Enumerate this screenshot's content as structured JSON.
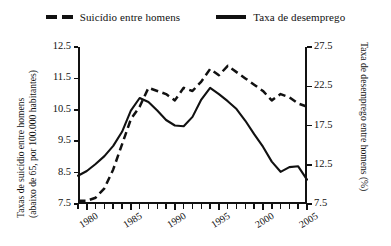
{
  "legend": {
    "items": [
      {
        "label": "Suicídio entre homens",
        "marker": "dashed-line-swatch",
        "color": "#111111"
      },
      {
        "label": "Taxa de desemprego",
        "marker": "solid-line-swatch",
        "color": "#111111"
      }
    ]
  },
  "axes": {
    "left_title_line1": "Taxas de suicídio entre homens",
    "left_title_line2": "(abaixo de 65, por 100.000 habitantes)",
    "right_title": "Taxa de desemprego entre homens (%)",
    "left_ticks": [
      "12.5",
      "11.5",
      "10.5",
      "9.5",
      "8.5",
      "7.5"
    ],
    "right_ticks": [
      "27.5",
      "22.5",
      "17.5",
      "12.5",
      "7.5"
    ],
    "x_ticks": [
      "1980",
      "1985",
      "1990",
      "1995",
      "2000",
      "2005"
    ]
  },
  "chart_data": {
    "type": "line",
    "title": "",
    "xlabel": "",
    "ylabel": "Taxas de suicídio entre homens (abaixo de 65, por 100.000 habitantes)",
    "y2label": "Taxa de desemprego entre homens (%)",
    "xlim": [
      1979,
      2005
    ],
    "ylim": [
      7.5,
      12.5
    ],
    "y2lim": [
      7.5,
      27.5
    ],
    "grid": false,
    "legend_position": "top-center",
    "x": [
      1979,
      1980,
      1981,
      1982,
      1983,
      1984,
      1985,
      1986,
      1987,
      1988,
      1989,
      1990,
      1991,
      1992,
      1993,
      1994,
      1995,
      1996,
      1997,
      1998,
      1999,
      2000,
      2001,
      2002,
      2003,
      2004,
      2005
    ],
    "series": [
      {
        "name": "Suicídio entre homens",
        "axis": "left",
        "style": "dashed",
        "values": [
          7.6,
          7.6,
          7.7,
          8.0,
          8.6,
          9.4,
          10.2,
          10.6,
          11.2,
          11.1,
          11.0,
          10.8,
          11.2,
          11.1,
          11.4,
          11.8,
          11.6,
          11.9,
          11.7,
          11.5,
          11.3,
          11.1,
          10.8,
          11.0,
          10.9,
          10.7,
          10.6
        ]
      },
      {
        "name": "Taxa de desemprego",
        "axis": "right",
        "style": "solid",
        "values": [
          11.1,
          11.7,
          12.6,
          13.6,
          14.9,
          16.7,
          19.4,
          21.0,
          20.5,
          19.4,
          18.2,
          17.5,
          17.4,
          18.6,
          20.8,
          22.3,
          21.5,
          20.6,
          19.6,
          18.1,
          16.4,
          14.8,
          12.9,
          11.6,
          12.2,
          12.3,
          10.6
        ]
      }
    ]
  }
}
